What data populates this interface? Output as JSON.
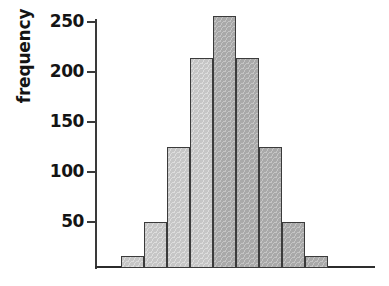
{
  "chart_data": {
    "type": "bar",
    "title": "",
    "subtitle": "",
    "xlabel": "",
    "ylabel": "frequency",
    "categories": [
      "1",
      "2",
      "3",
      "4",
      "5",
      "6",
      "7",
      "8",
      "9",
      "10",
      "11"
    ],
    "values": [
      2,
      12,
      46,
      121,
      210,
      252,
      210,
      121,
      46,
      12,
      2
    ],
    "ylim": [
      0,
      268
    ],
    "xlim": [
      0,
      11
    ],
    "y_ticks": [
      50,
      100,
      150,
      200,
      250
    ],
    "y_tick_labels": [
      "50",
      "100",
      "150",
      "200",
      "250"
    ],
    "x_ticks": [],
    "x_tick_labels": [],
    "grid": false,
    "legend": null,
    "legend_position": "none",
    "annotations": [],
    "bar_shades": [
      "dark",
      "light",
      "light",
      "light",
      "light",
      "dark",
      "dark",
      "dark",
      "dark",
      "dark",
      "dark"
    ]
  },
  "axis": {
    "y_title": "frequency",
    "tick_50": "50",
    "tick_100": "100",
    "tick_150": "150",
    "tick_200": "200",
    "tick_250": "250"
  },
  "colors": {
    "background": "#ffffff",
    "axis": "#3a3a3a",
    "bar_light": "#c6c6c6",
    "bar_dark": "#a9a9a9",
    "bar_tiny": "#8f8f8f",
    "bar_outline": "#3b3b3b",
    "text": "#141414"
  }
}
